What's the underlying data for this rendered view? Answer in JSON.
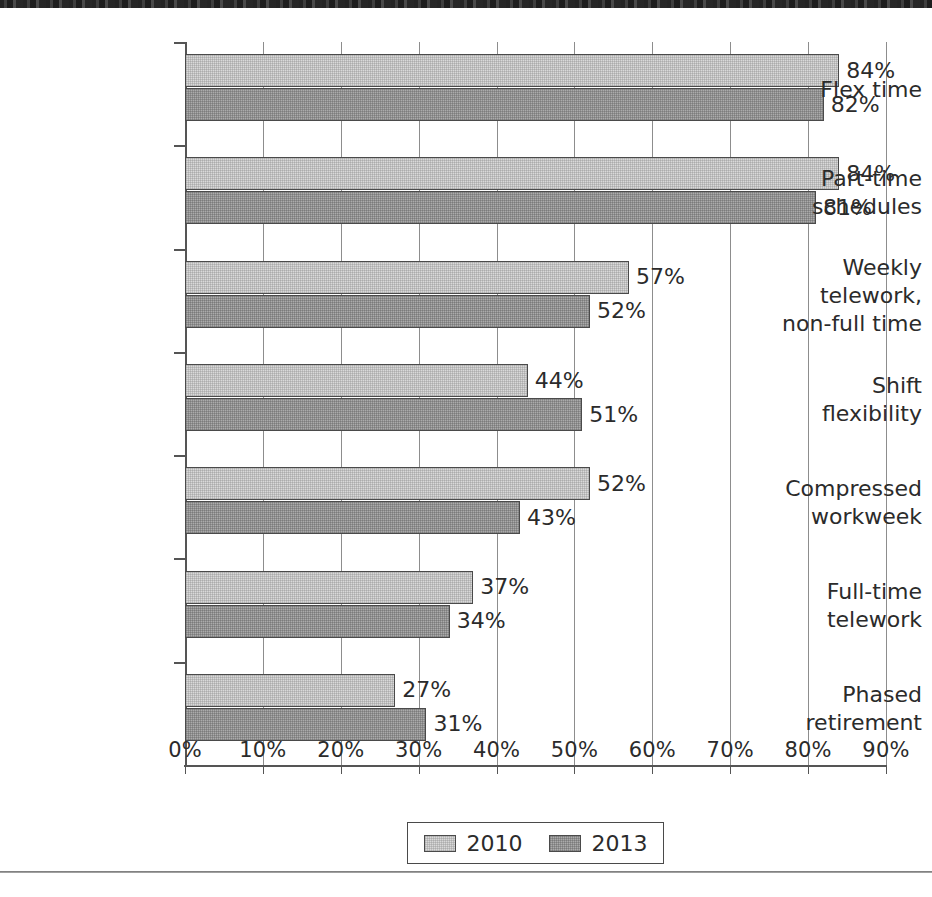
{
  "chart_data": {
    "type": "bar",
    "orientation": "horizontal",
    "title": "",
    "xlabel": "",
    "ylabel": "",
    "xlim": [
      0,
      90
    ],
    "xticks": [
      0,
      10,
      20,
      30,
      40,
      50,
      60,
      70,
      80,
      90
    ],
    "xticklabels": [
      "0%",
      "10%",
      "20%",
      "30%",
      "40%",
      "50%",
      "60%",
      "70%",
      "80%",
      "90%"
    ],
    "grid": true,
    "legend_position": "bottom-center",
    "value_suffix": "%",
    "categories": [
      "Flex time",
      "Part-time schedules",
      "Weekly telework, non-full time",
      "Shift flexibility",
      "Compressed workweek",
      "Full-time telework",
      "Phased retirement"
    ],
    "category_lines": [
      [
        "Flex time"
      ],
      [
        "Part-time",
        "schedules"
      ],
      [
        "Weekly",
        "telework,",
        "non-full time"
      ],
      [
        "Shift",
        "flexibility"
      ],
      [
        "Compressed",
        "workweek"
      ],
      [
        "Full-time",
        "telework"
      ],
      [
        "Phased",
        "retirement"
      ]
    ],
    "series": [
      {
        "name": "2010",
        "color": "#d9d9d9",
        "values": [
          84,
          84,
          57,
          44,
          52,
          37,
          27
        ],
        "labels": [
          "84%",
          "84%",
          "57%",
          "44%",
          "52%",
          "37%",
          "27%"
        ]
      },
      {
        "name": "2013",
        "color": "#ababab",
        "values": [
          82,
          81,
          52,
          51,
          43,
          34,
          31
        ],
        "labels": [
          "82%",
          "81%",
          "52%",
          "51%",
          "43%",
          "34%",
          "31%"
        ]
      }
    ]
  },
  "legend": {
    "entries": [
      {
        "label": "2010"
      },
      {
        "label": "2013"
      }
    ]
  },
  "colors": {
    "series_2010": "#d9d9d9",
    "series_2013": "#ababab",
    "axis": "#555555",
    "grid": "#8d8d8d",
    "text": "#2b2b2b",
    "background": "#ffffff"
  }
}
